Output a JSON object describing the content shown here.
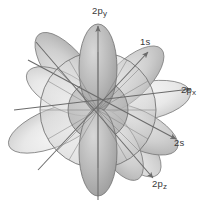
{
  "figure": {
    "background_color": "#ffffff",
    "line_color": "#6b6b6b",
    "label_color": "#3a3a3a"
  },
  "axes": [
    {
      "id": "2py",
      "label_main": "2p",
      "label_sub": "y",
      "label_full": "2py",
      "direction": "up",
      "angle_deg": 90,
      "label_x": 92,
      "label_y": 14
    },
    {
      "id": "1s",
      "label_main": "1s",
      "label_sub": "",
      "label_full": "1s",
      "direction": "up-right",
      "angle_deg": 47,
      "label_x": 140,
      "label_y": 45
    },
    {
      "id": "2px",
      "label_main": "2p",
      "label_sub": "x",
      "label_full": "2px",
      "direction": "right",
      "angle_deg": 0,
      "label_x": 181,
      "label_y": 93
    },
    {
      "id": "2s",
      "label_main": "2s",
      "label_sub": "",
      "label_full": "2s",
      "direction": "down-right",
      "angle_deg": -22,
      "label_x": 174,
      "label_y": 146
    },
    {
      "id": "2pz",
      "label_main": "2p",
      "label_sub": "z",
      "label_full": "2pz",
      "direction": "down-right-steep",
      "angle_deg": -52,
      "label_x": 152,
      "label_y": 187
    }
  ],
  "shells": {
    "inner_radius": 30,
    "outer_radius": 58,
    "description": "concentric spherical s-orbital shells"
  },
  "lobes": {
    "count": 12,
    "description": "p-orbital lobes radiating from origin"
  },
  "center": {
    "x": 98,
    "y": 110
  }
}
